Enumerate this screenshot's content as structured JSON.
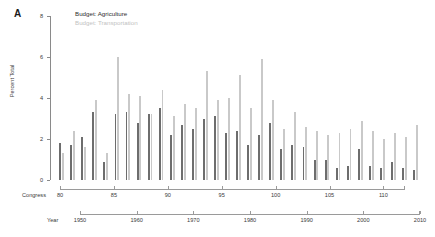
{
  "panel": {
    "label": "A"
  },
  "legend": {
    "position": "top-left",
    "entries": [
      {
        "label": "Budget: Agriculture",
        "color": "#6d6d6d"
      },
      {
        "label": "Budget: Transportation",
        "color": "#c9c9c9"
      }
    ]
  },
  "axes": {
    "y": {
      "label": "Percent Total",
      "ticks": [
        0,
        2,
        4,
        6,
        8
      ],
      "range": [
        0,
        8
      ]
    },
    "x_primary": {
      "name": "Congress",
      "ticks": [
        80,
        85,
        90,
        95,
        100,
        105,
        110
      ],
      "range": [
        80,
        112
      ]
    },
    "x_secondary": {
      "name": "Year",
      "ticks": [
        1950,
        1960,
        1970,
        1980,
        1990,
        2000,
        2010
      ],
      "range": [
        1947,
        2013
      ]
    }
  },
  "chart_data": {
    "type": "bar",
    "title": "",
    "subtitle": "",
    "xlabel": "Congress",
    "ylabel": "Percent Total",
    "ylim": [
      0,
      8
    ],
    "xlim": [
      80,
      112
    ],
    "grid": false,
    "legend_position": "top-left",
    "annotations": [
      "A"
    ],
    "categories": [
      80,
      81,
      82,
      83,
      84,
      85,
      86,
      87,
      88,
      89,
      90,
      91,
      92,
      93,
      94,
      95,
      96,
      97,
      98,
      99,
      100,
      101,
      102,
      103,
      104,
      105,
      106,
      107,
      108,
      109,
      110,
      111,
      112
    ],
    "tick_labels_secondary": [
      1947,
      1949,
      1951,
      1953,
      1955,
      1957,
      1959,
      1961,
      1963,
      1965,
      1967,
      1969,
      1971,
      1973,
      1975,
      1977,
      1979,
      1981,
      1983,
      1985,
      1987,
      1989,
      1991,
      1993,
      1995,
      1997,
      1999,
      2001,
      2003,
      2005,
      2007,
      2009,
      2011
    ],
    "series": [
      {
        "name": "Budget: Agriculture",
        "color": "#6d6d6d",
        "values": [
          1.8,
          1.7,
          2.1,
          3.3,
          0.9,
          3.2,
          3.3,
          2.8,
          3.2,
          3.5,
          2.2,
          2.7,
          2.5,
          3.0,
          3.1,
          2.3,
          2.4,
          1.7,
          2.2,
          2.8,
          1.5,
          1.7,
          1.6,
          1.0,
          1.0,
          0.6,
          0.7,
          1.5,
          0.7,
          0.6,
          0.9,
          0.6,
          0.5
        ]
      },
      {
        "name": "Budget: Transportation",
        "color": "#c9c9c9",
        "values": [
          1.3,
          2.4,
          1.6,
          3.9,
          1.3,
          6.0,
          4.2,
          4.1,
          3.2,
          4.4,
          3.1,
          3.7,
          3.5,
          5.3,
          3.9,
          4.0,
          5.1,
          3.5,
          5.9,
          3.9,
          2.5,
          3.3,
          2.6,
          2.4,
          2.2,
          2.3,
          2.5,
          2.9,
          2.4,
          2.0,
          2.3,
          2.1,
          2.7
        ]
      }
    ]
  }
}
